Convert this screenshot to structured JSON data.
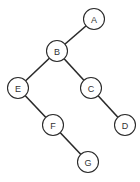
{
  "diagram": {
    "type": "binary-tree",
    "nodes": [
      {
        "id": "A",
        "label": "A"
      },
      {
        "id": "B",
        "label": "B"
      },
      {
        "id": "C",
        "label": "C"
      },
      {
        "id": "D",
        "label": "D"
      },
      {
        "id": "E",
        "label": "E"
      },
      {
        "id": "F",
        "label": "F"
      },
      {
        "id": "G",
        "label": "G"
      }
    ],
    "edges": [
      {
        "from": "A",
        "to": "B",
        "side": "left"
      },
      {
        "from": "B",
        "to": "E",
        "side": "left"
      },
      {
        "from": "B",
        "to": "C",
        "side": "right"
      },
      {
        "from": "C",
        "to": "D",
        "side": "right"
      },
      {
        "from": "E",
        "to": "F",
        "side": "right"
      },
      {
        "from": "F",
        "to": "G",
        "side": "right"
      }
    ],
    "colors": {
      "stroke": "#2a2a2a",
      "text": "#333333",
      "background": "#ffffff"
    }
  }
}
